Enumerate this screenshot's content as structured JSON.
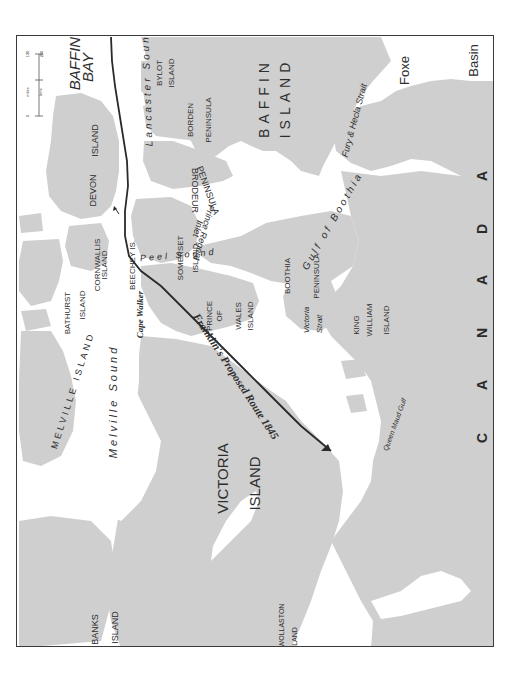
{
  "map": {
    "orientation": "rotated 90 degrees counterclockwise",
    "colors": {
      "land": "#cfcfcf",
      "water": "#ffffff",
      "frame": "#3a3a3a",
      "route": "#2a2a2a",
      "text": "#2e2e2e"
    },
    "route": {
      "label": "Franklin's Proposed Route 1845"
    },
    "scale_bar": {
      "units_top": "miles",
      "units_bottom": "kms",
      "tick_start": "0",
      "tick_mid": "120",
      "tick_end": "200"
    },
    "country": {
      "letters": [
        "C",
        "A",
        "N",
        "A",
        "D",
        "A"
      ]
    },
    "labels": {
      "baffin_bay_1": "BAFFIN",
      "baffin_bay_2": "BAY",
      "lancaster_sound": "Lancaster   Sound",
      "bylot_1": "BYLOT",
      "bylot_2": "ISLAND",
      "borden_1": "BORDEN",
      "borden_2": "PENINSULA",
      "baffin_island_1": "BAFFIN",
      "baffin_island_2": "ISLAND",
      "foxe": "Foxe",
      "basin": "Basin",
      "fury_hecla": "Fury & Hecla Strait",
      "devon_1": "DEVON",
      "devon_2": "ISLAND",
      "brodeur_1": "BRODEUR",
      "brodeur_2": "PENINSULA",
      "gulf_boothia": "Gulf   of   Boothia",
      "prince_regent_1": "Prince Regent",
      "prince_regent_2": "Inlet",
      "cornwallis_1": "CORNWALLIS",
      "cornwallis_2": "ISLAND",
      "beechey": "BEECHEY IS.",
      "somerset_1": "SOMERSET",
      "somerset_2": "ISLAND",
      "bathurst_1": "BATHURST",
      "bathurst_2": "ISLAND",
      "peel_sound": "Peel Sound",
      "boothia_1": "BOOTHIA",
      "boothia_2": "PENINSULA",
      "cape_walker": "Cape Walker",
      "prince_wales_1": "PRINCE",
      "prince_wales_2": "OF",
      "prince_wales_3": "WALES",
      "prince_wales_4": "ISLAND",
      "victoria_strait_1": "Victoria",
      "victoria_strait_2": "Strait",
      "king_william_1": "KING",
      "king_william_2": "WILLIAM",
      "king_william_3": "ISLAND",
      "melville_island": "MELVILLE ISLAND",
      "melville_sound": "Melville      Sound",
      "queen_maud": "Queen Maud Gulf",
      "victoria_island_1": "VICTORIA",
      "victoria_island_2": "ISLAND",
      "banks_1": "BANKS",
      "banks_2": "ISLAND",
      "wollaston_1": "WOLLASTON",
      "wollaston_2": "LAND"
    }
  }
}
